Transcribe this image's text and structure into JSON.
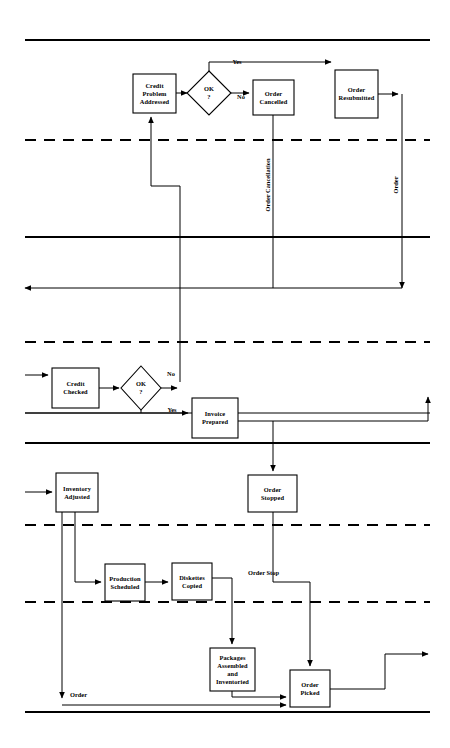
{
  "figure": {
    "type": "flowchart",
    "orientation": "swimlane-banded",
    "background": "#ffffff",
    "line_color": "#000000"
  },
  "bands": [
    {
      "id": "band-top-solid",
      "style": "solid",
      "y": 40,
      "x1": 25,
      "x2": 430
    },
    {
      "id": "band-dashed-1",
      "style": "dashed",
      "y": 140,
      "x1": 25,
      "x2": 430
    },
    {
      "id": "band-solid-2",
      "style": "solid",
      "y": 237,
      "x1": 25,
      "x2": 430
    },
    {
      "id": "band-dashed-2",
      "style": "dashed",
      "y": 342,
      "x1": 25,
      "x2": 430
    },
    {
      "id": "band-thin-1",
      "style": "thin",
      "y": 413,
      "x1": 25,
      "x2": 430
    },
    {
      "id": "band-solid-3",
      "style": "solid",
      "y": 443,
      "x1": 25,
      "x2": 430
    },
    {
      "id": "band-dashed-3",
      "style": "dashed",
      "y": 525,
      "x1": 25,
      "x2": 430
    },
    {
      "id": "band-dashed-4",
      "style": "dashed",
      "y": 602,
      "x1": 25,
      "x2": 430
    },
    {
      "id": "band-bottom-solid",
      "style": "solid",
      "y": 712,
      "x1": 25,
      "x2": 430
    }
  ],
  "nodes": [
    {
      "id": "credit-problem-addressed",
      "shape": "box",
      "x": 133,
      "y": 74,
      "w": 43,
      "h": 39,
      "lines": [
        "Credit",
        "Problem",
        "Addressed"
      ]
    },
    {
      "id": "ok-decision-top",
      "shape": "diamond",
      "cx": 209,
      "cy": 93,
      "rx": 22,
      "ry": 22,
      "lines": [
        "OK",
        "?"
      ]
    },
    {
      "id": "order-cancelled",
      "shape": "box",
      "x": 253,
      "y": 80,
      "w": 41,
      "h": 35,
      "lines": [
        "Order",
        "Cancelled"
      ]
    },
    {
      "id": "order-resubmitted",
      "shape": "box",
      "x": 335,
      "y": 70,
      "w": 43,
      "h": 48,
      "lines": [
        "Order",
        "Resubmitted"
      ]
    },
    {
      "id": "credit-checked",
      "shape": "box",
      "x": 52,
      "y": 368,
      "w": 47,
      "h": 40,
      "lines": [
        "Credit",
        "Checked"
      ]
    },
    {
      "id": "ok-decision-bottom",
      "shape": "diamond",
      "cx": 141,
      "cy": 388,
      "rx": 20,
      "ry": 22,
      "lines": [
        "OK",
        "?"
      ]
    },
    {
      "id": "invoice-prepared",
      "shape": "box",
      "x": 192,
      "y": 398,
      "w": 46,
      "h": 40,
      "lines": [
        "Invoice",
        "Prepared"
      ]
    },
    {
      "id": "order-stopped",
      "shape": "box",
      "x": 248,
      "y": 475,
      "w": 49,
      "h": 37,
      "lines": [
        "Order",
        "Stopped"
      ]
    },
    {
      "id": "inventory-adjusted",
      "shape": "box",
      "x": 56,
      "y": 473,
      "w": 42,
      "h": 39,
      "lines": [
        "Inventory",
        "Adjusted"
      ]
    },
    {
      "id": "production-scheduled",
      "shape": "box",
      "x": 105,
      "y": 564,
      "w": 40,
      "h": 37,
      "lines": [
        "Production",
        "Scheduled"
      ]
    },
    {
      "id": "diskettes-copied",
      "shape": "box",
      "x": 172,
      "y": 563,
      "w": 40,
      "h": 37,
      "lines": [
        "Diskettes",
        "Copied"
      ]
    },
    {
      "id": "packages-assembled",
      "shape": "box",
      "x": 210,
      "y": 648,
      "w": 45,
      "h": 43,
      "lines": [
        "Packages",
        "Assembled",
        "and",
        "Inventoried"
      ]
    },
    {
      "id": "order-picked",
      "shape": "box",
      "x": 290,
      "y": 670,
      "w": 40,
      "h": 37,
      "lines": [
        "Order",
        "Picked"
      ]
    }
  ],
  "edge_labels": [
    {
      "id": "label-yes-top",
      "text": "Yes",
      "x": 237,
      "y": 64,
      "rotate": 0,
      "align": "middle"
    },
    {
      "id": "label-no-top",
      "text": "No",
      "x": 241,
      "y": 99,
      "rotate": 0,
      "align": "middle"
    },
    {
      "id": "label-order-cancellation",
      "text": "Order Cancellation",
      "x": 270,
      "y": 185,
      "rotate": -90,
      "align": "middle"
    },
    {
      "id": "label-order-vertical",
      "text": "Order",
      "x": 398,
      "y": 185,
      "rotate": -90,
      "align": "middle"
    },
    {
      "id": "label-no-bottom",
      "text": "No",
      "x": 171,
      "y": 376,
      "rotate": 0,
      "align": "middle"
    },
    {
      "id": "label-yes-bottom",
      "text": "Yes",
      "x": 172,
      "y": 412,
      "rotate": 0,
      "align": "middle"
    },
    {
      "id": "label-order-stop",
      "text": "Order Stop",
      "x": 248,
      "y": 575,
      "rotate": 0,
      "align": "start"
    },
    {
      "id": "label-order-bottom",
      "text": "Order",
      "x": 70,
      "y": 697,
      "rotate": 0,
      "align": "start"
    }
  ],
  "edges": [
    {
      "id": "edge-problem-to-ok",
      "path": "M176,93 L187,93",
      "arrow": "end"
    },
    {
      "id": "edge-ok-yes-to-resubmitted",
      "path": "M209,71 L209,62 L331,62",
      "arrow": "end"
    },
    {
      "id": "edge-ok-no-to-cancelled",
      "path": "M231,93 L249,93",
      "arrow": "end"
    },
    {
      "id": "edge-resubmitted-right",
      "path": "M378,94 L398,94",
      "arrow": "end"
    },
    {
      "id": "edge-order-down-to-left",
      "path": "M402,94 L402,288",
      "arrow": "end"
    },
    {
      "id": "edge-cancelled-down",
      "path": "M273,115 L273,288",
      "arrow": "none"
    },
    {
      "id": "edge-return-left",
      "path": "M402,288 L25,288",
      "arrow": "end"
    },
    {
      "id": "edge-feedback-to-problem",
      "path": "M180,382 L180,186 L151,186 L151,117",
      "arrow": "end"
    },
    {
      "id": "edge-in-credit-checked",
      "path": "M25,375 L48,375",
      "arrow": "end"
    },
    {
      "id": "edge-checked-to-ok2",
      "path": "M99,388 L119,388",
      "arrow": "end"
    },
    {
      "id": "edge-ok2-no-up",
      "path": "M161,388 L177,388",
      "arrow": "end"
    },
    {
      "id": "edge-yes-line-to-invoice",
      "path": "M25,413 L188,413",
      "arrow": "end"
    },
    {
      "id": "edge-ok2-yes-down",
      "path": "M141,410 L141,413",
      "arrow": "none"
    },
    {
      "id": "edge-invoice-right-up",
      "path": "M238,421 L428,421 L428,397",
      "arrow": "end"
    },
    {
      "id": "edge-invoice-to-stopped",
      "path": "M273,421 L273,471",
      "arrow": "end"
    },
    {
      "id": "edge-in-inventory",
      "path": "M25,492 L52,492",
      "arrow": "end"
    },
    {
      "id": "edge-stopped-down",
      "path": "M273,512 L273,582 L310,582 L310,666",
      "arrow": "end"
    },
    {
      "id": "edge-inventory-to-production",
      "path": "M75,512 L75,582 L101,582",
      "arrow": "end"
    },
    {
      "id": "edge-inventory-down-order",
      "path": "M62,512 L62,698",
      "arrow": "end"
    },
    {
      "id": "edge-production-to-diskettes",
      "path": "M145,582 L168,582",
      "arrow": "end"
    },
    {
      "id": "edge-diskettes-to-packages",
      "path": "M212,578 L232,578 L232,644",
      "arrow": "end"
    },
    {
      "id": "edge-packages-to-picked",
      "path": "M232,691 L232,697 L286,697",
      "arrow": "end"
    },
    {
      "id": "edge-order-line-to-picked",
      "path": "M62,705 L286,705",
      "arrow": "end"
    },
    {
      "id": "edge-picked-out-right",
      "path": "M330,689 L385,689 L385,654 L428,654",
      "arrow": "end"
    }
  ]
}
